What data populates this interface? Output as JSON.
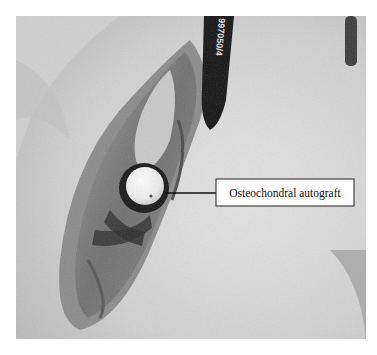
{
  "figure": {
    "annotation": {
      "label": "Osteochondral autograft"
    },
    "marker_pen_text": "997050/4"
  }
}
